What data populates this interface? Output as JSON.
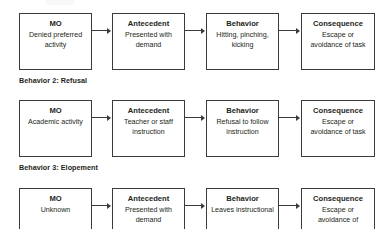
{
  "document": {
    "background_color": "#ffffff",
    "line_color": "#3b3b3b",
    "text_color": "#231f20"
  },
  "sections": [
    {
      "id": "behavior-1",
      "label": "",
      "label_visible": false,
      "top": 13,
      "nodes": [
        {
          "title": "MO",
          "desc": "Denied preferred activity"
        },
        {
          "title": "Antecedent",
          "desc": "Presented with demand"
        },
        {
          "title": "Behavior",
          "desc": "Hitting, pinching, kicking"
        },
        {
          "title": "Consequence",
          "desc": "Escape or avoidance of task"
        }
      ]
    },
    {
      "id": "behavior-2",
      "label": "Behavior 2: Refusal",
      "label_visible": true,
      "label_top": 76,
      "top": 100,
      "nodes": [
        {
          "title": "MO",
          "desc": "Academic activity"
        },
        {
          "title": "Antecedent",
          "desc": "Teacher or staff instruction"
        },
        {
          "title": "Behavior",
          "desc": "Refusal to follow instruction"
        },
        {
          "title": "Consequence",
          "desc": "Escape or avoidance of task"
        }
      ]
    },
    {
      "id": "behavior-3",
      "label": "Behavior 3: Elopement",
      "label_visible": true,
      "label_top": 163,
      "top": 188,
      "nodes": [
        {
          "title": "MO",
          "desc": "Unknown"
        },
        {
          "title": "Antecedent",
          "desc": "Presented with demand"
        },
        {
          "title": "Behavior",
          "desc": "Leaves instructional"
        },
        {
          "title": "Consequence",
          "desc": "Escape or avoidance of"
        }
      ]
    }
  ],
  "layout": {
    "box_lefts": [
      19,
      112,
      206,
      301
    ],
    "box_width": 73,
    "box_height": 57,
    "arrow_y_offset": 17
  }
}
